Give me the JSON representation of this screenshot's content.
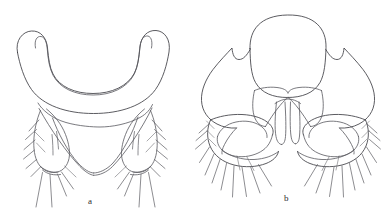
{
  "plate": {
    "title": "Two-panel scientific line drawing plate",
    "background_color": "#ffffff",
    "ink_color": "#58585e",
    "width": 384,
    "height": 223
  },
  "panels": [
    {
      "id": "a",
      "label": "a",
      "label_x": 88,
      "label_y": 197,
      "description": "Ventral view of insect terminalia: broad U-shaped arched sclerite above a triangular subgenital plate flanked by two setose lateral lobes"
    },
    {
      "id": "b",
      "label": "b",
      "label_x": 284,
      "label_y": 194,
      "description": "Ventral view of insect terminalia: rounded dorsal plate over a winged sclerite with paired hooks, three median prongs, and setose lateral lobes"
    }
  ],
  "figure_caption": ""
}
